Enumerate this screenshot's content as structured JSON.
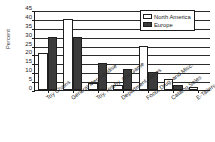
{
  "chart_data": {
    "type": "bar",
    "title": "",
    "xlabel": "",
    "ylabel": "Percent",
    "ylim": [
      0,
      45
    ],
    "ytick_step": 5,
    "yticks": [
      45,
      40,
      35,
      30,
      25,
      20,
      15,
      10,
      5,
      0
    ],
    "grid": true,
    "grid_axis": "y",
    "legend_position": "top-right",
    "categories": [
      "Toy Chains",
      "General Merchandise",
      "Toy, Hobby, and Game",
      "Department Stores",
      "Food, Drug, and Misc.",
      "Catalog Sales",
      "E-Tailers"
    ],
    "series": [
      {
        "name": "North America",
        "color": "#ffffff",
        "values": [
          21,
          40,
          4,
          3,
          25,
          6,
          1.5
        ]
      },
      {
        "name": "Europe",
        "color": "#3b3b3b",
        "values": [
          30,
          30,
          15,
          12,
          10,
          3,
          0
        ]
      }
    ]
  },
  "axis": {
    "y_title": "Percent"
  },
  "legend": {
    "entries": [
      {
        "label": "North America",
        "swatch": "north-america-swatch"
      },
      {
        "label": "Europe",
        "swatch": "europe-swatch"
      }
    ]
  },
  "colors": {
    "north_america": "#ffffff",
    "europe": "#3b3b3b",
    "axis": "#1c1c1c",
    "gridline": "#2b2b2b",
    "background": "#ffffff"
  }
}
